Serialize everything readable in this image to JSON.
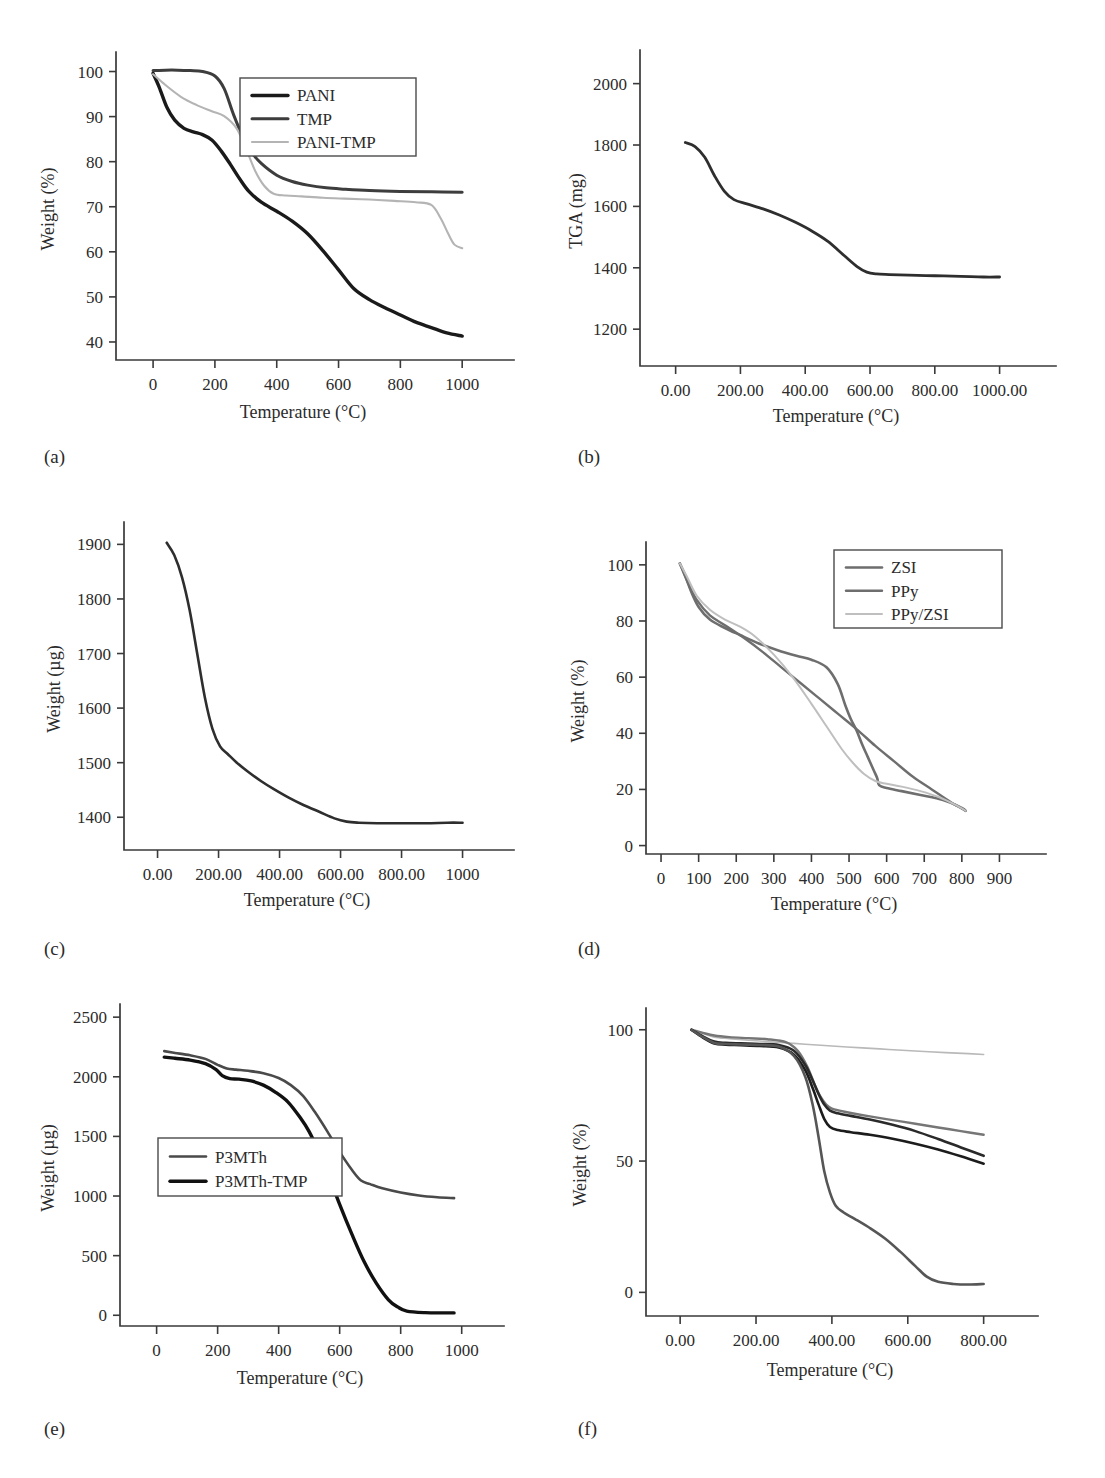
{
  "figure": {
    "panel_labels": [
      "(a)",
      "(b)",
      "(c)",
      "(d)",
      "(e)",
      "(f)"
    ],
    "common_xlabel": "Temperature (°C)"
  },
  "chart_data": [
    {
      "id": "a",
      "type": "line",
      "title": "",
      "xlabel": "Temperature (°C)",
      "ylabel": "Weight (%)",
      "xlim": [
        -120,
        1090
      ],
      "ylim": [
        36,
        103
      ],
      "xticks": [
        0,
        200,
        400,
        600,
        800,
        1000
      ],
      "xticklabels": [
        "0",
        "200",
        "400",
        "600",
        "800",
        "1000"
      ],
      "yticks": [
        40,
        50,
        60,
        70,
        80,
        90,
        100
      ],
      "yticklabels": [
        "40",
        "50",
        "60",
        "70",
        "80",
        "90",
        "100"
      ],
      "grid": false,
      "legend_position": "upper-right",
      "series": [
        {
          "name": "PANI",
          "color": "#1a1a1a",
          "width": 3.4,
          "x": [
            0,
            20,
            45,
            70,
            100,
            130,
            160,
            190,
            220,
            250,
            280,
            310,
            350,
            400,
            450,
            500,
            550,
            600,
            650,
            700,
            750,
            800,
            850,
            900,
            950,
            1000
          ],
          "y": [
            99.6,
            96.5,
            92.0,
            89.2,
            87.4,
            86.6,
            86.0,
            84.8,
            82.4,
            79.4,
            76.2,
            73.4,
            71.0,
            69.0,
            66.8,
            64.0,
            60.2,
            56.0,
            51.8,
            49.4,
            47.6,
            46.0,
            44.4,
            43.2,
            42.0,
            41.3
          ]
        },
        {
          "name": "TMP",
          "color": "#3d3d3d",
          "width": 3.0,
          "x": [
            0,
            40,
            80,
            120,
            160,
            200,
            230,
            260,
            290,
            320,
            350,
            400,
            450,
            500,
            560,
            620,
            700,
            800,
            900,
            1000
          ],
          "y": [
            100.2,
            100.3,
            100.3,
            100.2,
            100.0,
            99.0,
            96.2,
            90.5,
            85.6,
            82.0,
            79.6,
            77.0,
            75.6,
            74.8,
            74.2,
            73.9,
            73.6,
            73.4,
            73.3,
            73.2
          ]
        },
        {
          "name": "PANI-TMP",
          "color": "#b4b4b4",
          "width": 2.1,
          "x": [
            0,
            40,
            90,
            140,
            190,
            230,
            270,
            300,
            330,
            360,
            390,
            430,
            480,
            550,
            620,
            700,
            780,
            850,
            900,
            930,
            955,
            975,
            1000
          ],
          "y": [
            99.4,
            97.0,
            94.4,
            92.6,
            91.2,
            90.1,
            87.4,
            83.0,
            78.0,
            74.6,
            72.9,
            72.5,
            72.3,
            72.0,
            71.8,
            71.6,
            71.3,
            71.0,
            70.4,
            67.5,
            64.0,
            61.6,
            60.8
          ]
        }
      ]
    },
    {
      "id": "b",
      "type": "line",
      "title": "",
      "xlabel": "Temperature (°C)",
      "ylabel": "TGA (mg)",
      "xlim": [
        -110,
        1100
      ],
      "ylim": [
        1080,
        2090
      ],
      "xticks": [
        0,
        200,
        400,
        600,
        800,
        1000
      ],
      "xticklabels": [
        "0.00",
        "200.00",
        "400.00",
        "600.00",
        "800.00",
        "1000.00"
      ],
      "yticks": [
        1200,
        1400,
        1600,
        1800,
        2000
      ],
      "yticklabels": [
        "1200",
        "1400",
        "1600",
        "1800",
        "2000"
      ],
      "grid": false,
      "legend_position": "none",
      "series": [
        {
          "name": "TGA",
          "color": "#2e2e2e",
          "width": 2.8,
          "x": [
            30,
            60,
            90,
            120,
            150,
            180,
            220,
            270,
            320,
            370,
            420,
            470,
            520,
            560,
            590,
            620,
            660,
            720,
            800,
            880,
            950,
            1000
          ],
          "y": [
            1808,
            1795,
            1760,
            1700,
            1650,
            1622,
            1608,
            1592,
            1572,
            1548,
            1520,
            1486,
            1440,
            1404,
            1386,
            1380,
            1378,
            1376,
            1374,
            1372,
            1370,
            1370
          ]
        }
      ]
    },
    {
      "id": "c",
      "type": "line",
      "title": "",
      "xlabel": "Temperature (°C)",
      "ylabel": "Weight (µg)",
      "xlim": [
        -110,
        1090
      ],
      "ylim": [
        1340,
        1930
      ],
      "xticks": [
        0,
        200,
        400,
        600,
        800,
        1000
      ],
      "xticklabels": [
        "0.00",
        "200.00",
        "400.00",
        "600.00",
        "800.00",
        "1000"
      ],
      "yticks": [
        1400,
        1500,
        1600,
        1700,
        1800,
        1900
      ],
      "yticklabels": [
        "1400",
        "1500",
        "1600",
        "1700",
        "1800",
        "1900"
      ],
      "grid": false,
      "legend_position": "none",
      "series": [
        {
          "name": "Weight",
          "color": "#2e2e2e",
          "width": 2.6,
          "x": [
            30,
            55,
            80,
            105,
            130,
            155,
            180,
            205,
            230,
            260,
            300,
            340,
            380,
            430,
            480,
            530,
            580,
            620,
            660,
            720,
            800,
            880,
            950,
            1000
          ],
          "y": [
            1903,
            1880,
            1840,
            1780,
            1700,
            1620,
            1562,
            1530,
            1516,
            1500,
            1482,
            1466,
            1452,
            1436,
            1422,
            1410,
            1398,
            1392,
            1390,
            1389,
            1389,
            1389,
            1390,
            1390
          ]
        }
      ]
    },
    {
      "id": "d",
      "type": "line",
      "title": "",
      "xlabel": "Temperature (°C)",
      "ylabel": "Weight (%)",
      "xlim": [
        -40,
        960
      ],
      "ylim": [
        -3,
        106
      ],
      "xticks": [
        0,
        100,
        200,
        300,
        400,
        500,
        600,
        700,
        800,
        900
      ],
      "xticklabels": [
        "0",
        "100",
        "200",
        "300",
        "400",
        "500",
        "600",
        "700",
        "800",
        "900"
      ],
      "yticks": [
        0,
        20,
        40,
        60,
        80,
        100
      ],
      "yticklabels": [
        "0",
        "20",
        "40",
        "60",
        "80",
        "100"
      ],
      "grid": false,
      "legend_position": "upper-right",
      "series": [
        {
          "name": "ZSI",
          "color": "#6e6e6e",
          "width": 2.6,
          "x": [
            50,
            65,
            80,
            100,
            130,
            170,
            210,
            260,
            310,
            360,
            400,
            440,
            470,
            490,
            505,
            520,
            535,
            550,
            565,
            575,
            580,
            600,
            640,
            690,
            750,
            800,
            810
          ],
          "y": [
            100.5,
            96.0,
            90.5,
            85.0,
            80.5,
            77.5,
            75.0,
            72.0,
            69.6,
            67.6,
            66.2,
            63.5,
            57.5,
            50.0,
            45.0,
            41.0,
            36.0,
            31.5,
            27.0,
            24.0,
            21.5,
            20.5,
            19.4,
            18.0,
            16.2,
            13.4,
            12.4
          ]
        },
        {
          "name": "PPy",
          "color": "#6e6e6e",
          "width": 2.4,
          "x": [
            50,
            70,
            95,
            130,
            170,
            220,
            270,
            320,
            370,
            420,
            470,
            520,
            570,
            620,
            670,
            720,
            770,
            810
          ],
          "y": [
            100.5,
            94.0,
            87.5,
            82.0,
            78.5,
            74.0,
            69.0,
            63.5,
            58.0,
            52.5,
            47.0,
            41.5,
            35.5,
            30.0,
            24.5,
            20.0,
            15.5,
            12.4
          ]
        },
        {
          "name": "PPy/ZSI",
          "color": "#bfbfbf",
          "width": 2.0,
          "x": [
            50,
            70,
            95,
            130,
            170,
            210,
            250,
            300,
            350,
            400,
            440,
            480,
            510,
            540,
            570,
            600,
            640,
            690,
            740,
            790,
            810
          ],
          "y": [
            100.5,
            95.5,
            89.0,
            84.0,
            80.5,
            78.0,
            74.5,
            68.0,
            60.0,
            50.5,
            42.5,
            34.5,
            29.5,
            25.5,
            23.0,
            22.0,
            21.0,
            19.4,
            17.2,
            14.0,
            12.4
          ]
        }
      ]
    },
    {
      "id": "e",
      "type": "line",
      "title": "",
      "xlabel": "Temperature (°C)",
      "ylabel": "Weight (µg)",
      "xlim": [
        -120,
        1060
      ],
      "ylim": [
        -90,
        2560
      ],
      "xticks": [
        0,
        200,
        400,
        600,
        800,
        1000
      ],
      "xticklabels": [
        "0",
        "200",
        "400",
        "600",
        "800",
        "1000"
      ],
      "yticks": [
        0,
        500,
        1000,
        1500,
        2000,
        2500
      ],
      "yticklabels": [
        "0",
        "500",
        "1000",
        "1500",
        "2000",
        "2500"
      ],
      "grid": false,
      "legend_position": "mid-left",
      "series": [
        {
          "name": "P3MTh",
          "color": "#4a4a4a",
          "width": 2.6,
          "x": [
            25,
            60,
            110,
            160,
            200,
            230,
            260,
            300,
            350,
            400,
            440,
            480,
            520,
            560,
            600,
            640,
            670,
            700,
            740,
            800,
            860,
            920,
            975
          ],
          "y": [
            2215,
            2200,
            2180,
            2150,
            2100,
            2070,
            2060,
            2050,
            2030,
            1990,
            1930,
            1840,
            1700,
            1540,
            1370,
            1220,
            1130,
            1100,
            1065,
            1030,
            1005,
            990,
            982
          ]
        },
        {
          "name": "P3MTh-TMP",
          "color": "#111111",
          "width": 3.4,
          "x": [
            25,
            60,
            110,
            160,
            195,
            215,
            240,
            270,
            310,
            350,
            390,
            430,
            470,
            500,
            530,
            560,
            600,
            640,
            680,
            720,
            760,
            790,
            820,
            880,
            940,
            975
          ],
          "y": [
            2165,
            2155,
            2140,
            2110,
            2060,
            2010,
            1985,
            1980,
            1965,
            1930,
            1870,
            1790,
            1660,
            1540,
            1380,
            1200,
            930,
            680,
            450,
            270,
            130,
            70,
            35,
            22,
            20,
            20
          ]
        }
      ]
    },
    {
      "id": "f",
      "type": "line",
      "title": "",
      "xlabel": "Temperature (°C)",
      "ylabel": "Weight (%)",
      "xlim": [
        -90,
        880
      ],
      "ylim": [
        -9,
        106
      ],
      "xticks": [
        0,
        200,
        400,
        600,
        800
      ],
      "xticklabels": [
        "0.00",
        "200.00",
        "400.00",
        "600.00",
        "800.00"
      ],
      "yticks": [
        0,
        50,
        100
      ],
      "yticklabels": [
        "0",
        "50",
        "100"
      ],
      "grid": false,
      "legend_position": "none",
      "series": [
        {
          "name": "curve-1",
          "color": "#b9b9b9",
          "width": 1.6,
          "x": [
            30,
            60,
            90,
            130,
            180,
            240,
            300,
            360,
            420,
            480,
            550,
            620,
            700,
            760,
            800
          ],
          "y": [
            100.0,
            98.6,
            97.2,
            96.6,
            96.0,
            95.4,
            94.8,
            94.2,
            93.6,
            93.1,
            92.5,
            91.9,
            91.3,
            90.9,
            90.6
          ]
        },
        {
          "name": "curve-2",
          "color": "#767676",
          "width": 2.4,
          "x": [
            30,
            60,
            90,
            130,
            180,
            230,
            280,
            310,
            335,
            355,
            370,
            385,
            400,
            420,
            450,
            500,
            560,
            620,
            680,
            740,
            800
          ],
          "y": [
            100.0,
            98.8,
            97.8,
            97.2,
            96.8,
            96.4,
            95.2,
            92.0,
            86.0,
            79.0,
            74.5,
            71.5,
            70.0,
            69.2,
            68.3,
            67.0,
            65.6,
            64.2,
            62.8,
            61.4,
            60.0
          ]
        },
        {
          "name": "curve-3",
          "color": "#2a2a2a",
          "width": 2.6,
          "x": [
            30,
            60,
            90,
            120,
            160,
            210,
            260,
            300,
            330,
            350,
            365,
            380,
            395,
            415,
            450,
            500,
            560,
            620,
            680,
            740,
            800
          ],
          "y": [
            100.0,
            97.5,
            95.5,
            95.0,
            94.8,
            94.6,
            94.2,
            92.0,
            86.5,
            80.5,
            75.5,
            71.5,
            69.2,
            68.2,
            67.2,
            65.8,
            63.8,
            61.4,
            58.4,
            55.2,
            52.0
          ]
        },
        {
          "name": "curve-4",
          "color": "#1c1c1c",
          "width": 2.6,
          "x": [
            30,
            60,
            90,
            120,
            160,
            210,
            260,
            300,
            330,
            350,
            365,
            380,
            395,
            415,
            450,
            500,
            560,
            620,
            680,
            740,
            800
          ],
          "y": [
            100.0,
            97.0,
            94.8,
            94.3,
            94.1,
            93.8,
            93.2,
            90.5,
            84.5,
            77.5,
            71.5,
            66.0,
            63.0,
            61.8,
            61.0,
            60.0,
            58.5,
            56.6,
            54.4,
            51.8,
            49.0
          ]
        },
        {
          "name": "curve-5",
          "color": "#565656",
          "width": 2.6,
          "x": [
            30,
            60,
            90,
            120,
            160,
            210,
            260,
            300,
            330,
            350,
            365,
            380,
            395,
            410,
            430,
            460,
            500,
            540,
            580,
            620,
            650,
            680,
            720,
            760,
            800
          ],
          "y": [
            100.0,
            97.2,
            95.0,
            94.6,
            94.4,
            94.2,
            93.6,
            90.0,
            82.0,
            71.0,
            59.0,
            46.0,
            38.0,
            33.0,
            30.5,
            28.0,
            24.5,
            20.5,
            15.5,
            10.0,
            6.0,
            4.0,
            3.2,
            3.0,
            3.2
          ]
        }
      ]
    }
  ]
}
